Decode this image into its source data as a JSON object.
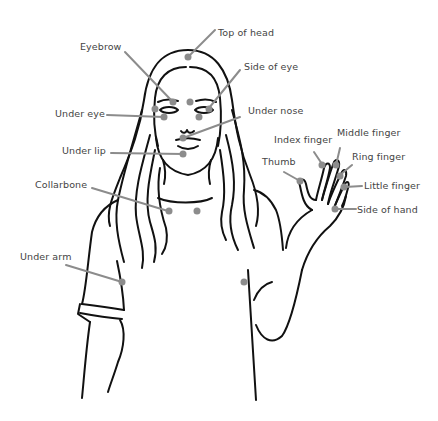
{
  "diagram": {
    "type": "labeled-illustration",
    "colors": {
      "outline": "#111111",
      "pointer": "#8c8c8c",
      "dot": "#8c8c8c",
      "label": "#444444",
      "background": "#ffffff"
    },
    "labels": {
      "top_of_head": "Top of head",
      "eyebrow": "Eyebrow",
      "side_of_eye": "Side of eye",
      "under_eye": "Under eye",
      "under_nose": "Under nose",
      "under_lip": "Under lip",
      "collarbone": "Collarbone",
      "under_arm": "Under arm",
      "thumb": "Thumb",
      "index_finger": "Index finger",
      "middle_finger": "Middle finger",
      "ring_finger": "Ring finger",
      "little_finger": "Little finger",
      "side_of_hand": "Side of hand"
    }
  }
}
